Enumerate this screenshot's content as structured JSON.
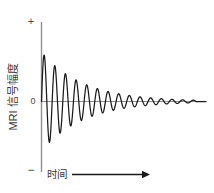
{
  "figure": {
    "title": "",
    "background_color": "#ffffff",
    "line_color": "#1a1a1a",
    "axis_color": "#8a8a8a",
    "text_color": "#3a3a3a"
  },
  "labels": {
    "y_axis": "MRI 信号幅度",
    "x_axis": "时间",
    "origin": "0",
    "plus": "+",
    "minus": "−",
    "arrow_icon": "right-arrow-icon"
  },
  "chart_data": {
    "type": "line",
    "title": "",
    "xlabel": "时间",
    "ylabel": "MRI 信号幅度",
    "grid": false,
    "legend": null,
    "xlim": [
      0,
      1
    ],
    "ylim": [
      -1.05,
      1.05
    ],
    "axis_ticks": {
      "y": [
        "+",
        "0",
        "−"
      ],
      "x": []
    },
    "signal": {
      "form": "A * exp(-t/T2star) * sin(2*pi*f*t)",
      "amplitude": 1.0,
      "frequency_cycles": 14.5,
      "decay_constant_t2star": 0.27,
      "samples": 600
    },
    "envelope_peaks": [
      {
        "cycle": 1,
        "amplitude": 0.97
      },
      {
        "cycle": 2,
        "amplitude": 0.8
      },
      {
        "cycle": 3,
        "amplitude": 0.66
      },
      {
        "cycle": 4,
        "amplitude": 0.53
      },
      {
        "cycle": 5,
        "amplitude": 0.42
      },
      {
        "cycle": 6,
        "amplitude": 0.33
      },
      {
        "cycle": 7,
        "amplitude": 0.26
      },
      {
        "cycle": 8,
        "amplitude": 0.21
      },
      {
        "cycle": 9,
        "amplitude": 0.16
      },
      {
        "cycle": 10,
        "amplitude": 0.12
      },
      {
        "cycle": 11,
        "amplitude": 0.09
      },
      {
        "cycle": 12,
        "amplitude": 0.07
      },
      {
        "cycle": 13,
        "amplitude": 0.05
      },
      {
        "cycle": 14,
        "amplitude": 0.03
      }
    ]
  }
}
